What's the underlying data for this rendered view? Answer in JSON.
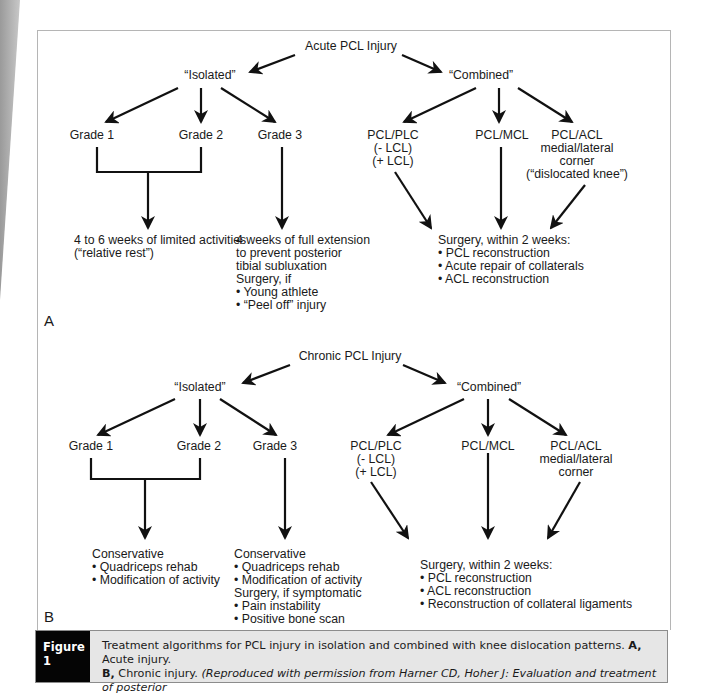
{
  "panel_a": {
    "label": "A",
    "root": "Acute PCL Injury",
    "isolated": {
      "label": "“Isolated”",
      "grades": [
        "Grade 1",
        "Grade 2",
        "Grade 3"
      ],
      "grade12_outcome": [
        "4 to 6 weeks of limited activities",
        "(“relative rest”)"
      ],
      "grade3_outcome": [
        "4 weeks of full extension",
        "to prevent posterior",
        "tibial subluxation",
        "Surgery, if",
        "• Young athlete",
        "• “Peel off” injury"
      ]
    },
    "combined": {
      "label": "“Combined”",
      "types": [
        [
          "PCL/PLC",
          "(- LCL)",
          "(+ LCL)"
        ],
        [
          "PCL/MCL"
        ],
        [
          "PCL/ACL",
          "medial/lateral",
          "corner",
          "(“dislocated knee”)"
        ]
      ],
      "outcome": [
        "Surgery, within 2 weeks:",
        "• PCL reconstruction",
        "• Acute repair of collaterals",
        "• ACL reconstruction"
      ]
    }
  },
  "panel_b": {
    "label": "B",
    "root": "Chronic PCL Injury",
    "isolated": {
      "label": "“Isolated”",
      "grades": [
        "Grade 1",
        "Grade 2",
        "Grade 3"
      ],
      "grade12_outcome": [
        "Conservative",
        "• Quadriceps rehab",
        "• Modification of activity"
      ],
      "grade3_outcome": [
        "Conservative",
        "• Quadriceps rehab",
        "• Modification of activity",
        "Surgery, if symptomatic",
        "• Pain instability",
        "• Positive bone scan"
      ]
    },
    "combined": {
      "label": "“Combined”",
      "types": [
        [
          "PCL/PLC",
          "(- LCL)",
          "(+ LCL)"
        ],
        [
          "PCL/MCL"
        ],
        [
          "PCL/ACL",
          "medial/lateral",
          "corner"
        ]
      ],
      "outcome": [
        "Surgery, within 2 weeks:",
        "• PCL reconstruction",
        "• ACL reconstruction",
        "• Reconstruction of collateral ligaments"
      ]
    }
  },
  "caption": {
    "tag": "Figure 1",
    "line1_plain": "Treatment algorithms for PCL injury in isolation and combined with knee dislocation patterns. ",
    "line1_bold": "A,",
    "line1_tail": " Acute injury.",
    "line2_bold": "B,",
    "line2_plain": " Chronic injury. ",
    "line2_italic": "(Reproduced with permission from Harner CD, Hoher J: Evaluation and treatment of posterior",
    "line3_italic": "cruciate ligament injuries.",
    "line3_plain": " Am J Sports Med ",
    "line3_italic2": "1998;26:471-482.)"
  },
  "colors": {
    "caption_tag_bg": "#050505",
    "caption_bg": "#e6e6e6",
    "frame_border": "#b5b5b5"
  }
}
